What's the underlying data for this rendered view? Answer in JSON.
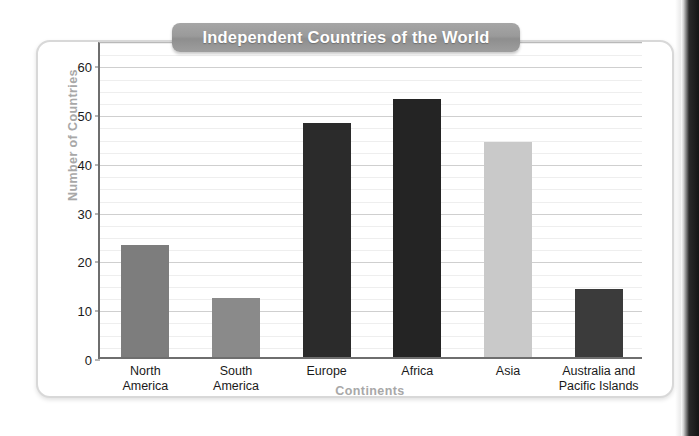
{
  "figure": {
    "title": "Independent Countries of the World"
  },
  "chart_data": {
    "type": "bar",
    "title": "Independent Countries of the World",
    "xlabel": "Continents",
    "ylabel": "Number of Countries",
    "categories": [
      "North\nAmerica",
      "South\nAmerica",
      "Europe",
      "Africa",
      "Asia",
      "Australia and\nPacific Islands"
    ],
    "values": [
      23,
      12,
      48,
      53,
      44,
      14
    ],
    "bar_colors": [
      "#7d7d7d",
      "#8a8a8a",
      "#2b2b2b",
      "#242424",
      "#c9c9c9",
      "#3b3b3b"
    ],
    "ylim": [
      0,
      65
    ],
    "yticks": [
      0,
      10,
      20,
      30,
      40,
      50,
      60
    ],
    "ytick_labels": [
      "0",
      "10",
      "20",
      "30",
      "40",
      "50",
      "60"
    ],
    "minor_tick_step": 2.5,
    "grid": true,
    "legend": "none"
  },
  "colors": {
    "axis": "#6e6e6e",
    "grid_major": "#cfcfcf",
    "grid_minor": "#eeeeee",
    "axis_title": "#a8a8a8",
    "banner": "#9a9a9a",
    "banner_text": "#ffffff",
    "card_border": "#d8d8d8"
  }
}
